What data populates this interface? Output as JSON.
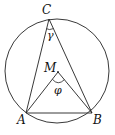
{
  "diagram": {
    "type": "inscribed-angle-geometry",
    "circle": {
      "cx": 57,
      "cy": 71,
      "r": 52
    },
    "points": {
      "A": {
        "x": 26,
        "y": 113,
        "label": "A"
      },
      "B": {
        "x": 92,
        "y": 113,
        "label": "B"
      },
      "C": {
        "x": 49,
        "y": 19,
        "label": "C"
      },
      "M": {
        "x": 58,
        "y": 72,
        "label": "M"
      }
    },
    "angles": {
      "gamma": {
        "label": "γ",
        "vertex": "C"
      },
      "phi": {
        "label": "φ",
        "vertex": "M"
      }
    },
    "stroke_color": "#222222"
  }
}
